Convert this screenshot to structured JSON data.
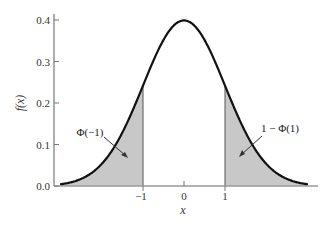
{
  "chart_data": {
    "type": "area",
    "title": "",
    "xlabel": "x",
    "ylabel": "f(x)",
    "xlim": [
      -3,
      3
    ],
    "ylim": [
      0,
      0.4
    ],
    "x_ticks": [
      -1,
      0,
      1
    ],
    "x_tick_labels": [
      "−1",
      "0",
      "1"
    ],
    "y_ticks": [
      0.0,
      0.1,
      0.2,
      0.3,
      0.4
    ],
    "y_tick_labels": [
      "0.0",
      "0.1",
      "0.2",
      "0.3",
      "0.4"
    ],
    "grid": false,
    "legend": null,
    "series": [
      {
        "name": "Standard normal density f(x)",
        "x": [
          -3,
          -2.5,
          -2,
          -1.5,
          -1,
          -0.5,
          0,
          0.5,
          1,
          1.5,
          2,
          2.5,
          3
        ],
        "y": [
          0.004,
          0.018,
          0.054,
          0.13,
          0.242,
          0.352,
          0.399,
          0.352,
          0.242,
          0.13,
          0.054,
          0.018,
          0.004
        ]
      }
    ],
    "shaded_regions": [
      {
        "from": -3,
        "to": -1,
        "label": "Φ(−1)",
        "color": "#c8c8c8"
      },
      {
        "from": 1,
        "to": 3,
        "label": "1 − Φ(1)",
        "color": "#c8c8c8"
      }
    ],
    "annotations": [
      {
        "text": "Φ(−1)",
        "points_to_x": -1.4,
        "points_to_y": 0.06
      },
      {
        "text": "1 − Φ(1)",
        "points_to_x": 1.4,
        "points_to_y": 0.06
      }
    ]
  },
  "labels": {
    "ylabel": "f(x)",
    "xlabel": "x",
    "y_ticks": [
      "0.0",
      "0.1",
      "0.2",
      "0.3",
      "0.4"
    ],
    "x_ticks": [
      "−1",
      "0",
      "1"
    ],
    "left_annotation": "Φ(−1)",
    "right_annotation": "1 − Φ(1)"
  },
  "colors": {
    "curve": "#111111",
    "shade": "#c8c8c8",
    "axis": "#666666"
  }
}
